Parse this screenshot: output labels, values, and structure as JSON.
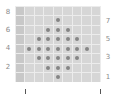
{
  "chart_data": {
    "type": "heatmap",
    "title": "",
    "grid": {
      "columns": 9,
      "rows": 8
    },
    "left_tick_labels": [
      "8",
      "6",
      "4",
      "2"
    ],
    "right_tick_labels": [
      "7",
      "5",
      "3",
      "1"
    ],
    "dots": [
      {
        "row": 1,
        "cols": [
          4
        ]
      },
      {
        "row": 2,
        "cols": [
          3,
          4,
          5
        ]
      },
      {
        "row": 3,
        "cols": [
          2,
          3,
          4,
          5,
          6
        ]
      },
      {
        "row": 4,
        "cols": [
          1,
          2,
          3,
          4,
          5,
          6,
          7
        ]
      },
      {
        "row": 5,
        "cols": [
          2,
          3,
          4,
          5,
          6
        ]
      },
      {
        "row": 6,
        "cols": [
          3,
          4,
          5
        ]
      },
      {
        "row": 7,
        "cols": [
          4
        ]
      }
    ],
    "colors": {
      "cell": "#d6d6d6",
      "first_column": "#c8c8c8",
      "gridline": "#ececec",
      "dot": "#858585"
    }
  },
  "labels": {
    "left": [
      {
        "text": "8",
        "y": 8
      },
      {
        "text": "6",
        "y": 26
      },
      {
        "text": "4",
        "y": 44
      },
      {
        "text": "2",
        "y": 63
      }
    ],
    "right": [
      {
        "text": "7",
        "y": 17
      },
      {
        "text": "5",
        "y": 35
      },
      {
        "text": "3",
        "y": 53
      },
      {
        "text": "1",
        "y": 73
      }
    ]
  }
}
